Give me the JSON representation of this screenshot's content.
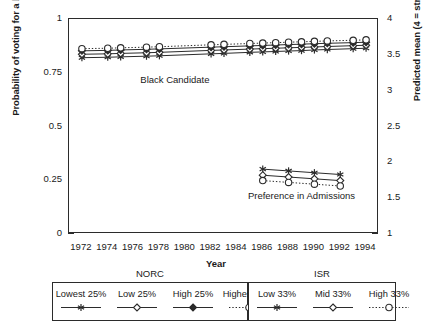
{
  "chart_data": {
    "type": "line",
    "title": "",
    "xlabel": "Year",
    "ylabel_left": "Probability of voting for a black candidate",
    "ylabel_right": "Predicted mean (4 = strongly favor)",
    "xlim": [
      1971,
      1995
    ],
    "ylim_left": [
      0,
      1
    ],
    "ylim_right": [
      1,
      4
    ],
    "yticks_left": [
      "0",
      "0.25",
      "0.5",
      "0.75",
      "1"
    ],
    "yticks_left_values": [
      0,
      0.25,
      0.5,
      0.75,
      1
    ],
    "yticks_right": [
      "1",
      "1.5",
      "2",
      "2.5",
      "3",
      "3.5",
      "4"
    ],
    "yticks_right_values": [
      1,
      1.5,
      2,
      2.5,
      3,
      3.5,
      4
    ],
    "xticks": [
      "1972",
      "1974",
      "1976",
      "1978",
      "1980",
      "1982",
      "1984",
      "1986",
      "1988",
      "1990",
      "1992",
      "1994"
    ],
    "xticks_values": [
      1972,
      1974,
      1976,
      1978,
      1980,
      1982,
      1984,
      1986,
      1988,
      1990,
      1992,
      1994
    ],
    "grid": false,
    "legend_position": "below",
    "annotations": [
      {
        "text": "Black Candidate",
        "x": 1979.2,
        "y": 0.715,
        "panel": "left"
      },
      {
        "text": "Preference in Admissions",
        "x": 1989.0,
        "y": 0.175,
        "panel": "left"
      }
    ],
    "panels": [
      {
        "name": "Black Candidate",
        "axis": "left",
        "x": [
          1972,
          1974,
          1975,
          1977,
          1978,
          1982,
          1983,
          1985,
          1986,
          1987,
          1988,
          1989,
          1990,
          1991,
          1993,
          1994
        ],
        "series": [
          {
            "name": "Lowest 25%",
            "group": "NORC",
            "marker": "asterisk",
            "line": "solid",
            "values": [
              0.82,
              0.822,
              0.824,
              0.827,
              0.829,
              0.838,
              0.84,
              0.845,
              0.847,
              0.849,
              0.851,
              0.853,
              0.856,
              0.858,
              0.862,
              0.864
            ]
          },
          {
            "name": "Low 25%",
            "group": "NORC",
            "marker": "open-diamond",
            "line": "solid",
            "values": [
              0.836,
              0.838,
              0.84,
              0.843,
              0.845,
              0.854,
              0.856,
              0.86,
              0.862,
              0.864,
              0.866,
              0.868,
              0.87,
              0.872,
              0.876,
              0.878
            ]
          },
          {
            "name": "High 25%",
            "group": "NORC",
            "marker": "filled-diamond",
            "line": "solid",
            "values": [
              0.852,
              0.854,
              0.856,
              0.859,
              0.861,
              0.869,
              0.871,
              0.875,
              0.877,
              0.879,
              0.881,
              0.883,
              0.885,
              0.887,
              0.89,
              0.892
            ]
          },
          {
            "name": "Highest 25%",
            "group": "NORC",
            "marker": "open-circle",
            "line": "dotted",
            "values": [
              0.862,
              0.864,
              0.866,
              0.869,
              0.871,
              0.88,
              0.882,
              0.886,
              0.888,
              0.89,
              0.892,
              0.894,
              0.896,
              0.898,
              0.901,
              0.903
            ]
          }
        ]
      },
      {
        "name": "Preference in Admissions",
        "axis": "right",
        "x": [
          1986,
          1988,
          1990,
          1992
        ],
        "series": [
          {
            "name": "Low 33%",
            "group": "ISR",
            "marker": "asterisk",
            "line": "solid",
            "values": [
              1.905,
              1.88,
              1.855,
              1.83
            ]
          },
          {
            "name": "Mid 33%",
            "group": "ISR",
            "marker": "open-diamond",
            "line": "solid",
            "values": [
              1.82,
              1.795,
              1.77,
              1.745
            ]
          },
          {
            "name": "High 33%",
            "group": "ISR",
            "marker": "open-circle",
            "line": "dotted",
            "values": [
              1.745,
              1.72,
              1.695,
              1.67
            ]
          }
        ]
      }
    ]
  },
  "legend": {
    "groups": [
      {
        "title": "NORC",
        "entries": [
          {
            "label": "Lowest 25%",
            "marker": "asterisk",
            "line": "solid"
          },
          {
            "label": "Low 25%",
            "marker": "open-diamond",
            "line": "solid"
          },
          {
            "label": "High 25%",
            "marker": "filled-diamond",
            "line": "solid"
          },
          {
            "label": "Highest 25%",
            "marker": "open-circle",
            "line": "dotted"
          }
        ]
      },
      {
        "title": "ISR",
        "entries": [
          {
            "label": "Low 33%",
            "marker": "asterisk",
            "line": "solid"
          },
          {
            "label": "Mid 33%",
            "marker": "open-diamond",
            "line": "solid"
          },
          {
            "label": "High 33%",
            "marker": "open-circle",
            "line": "dotted"
          }
        ]
      }
    ]
  },
  "colors": {
    "ink": "#2b2b2b",
    "background": "#ffffff"
  }
}
